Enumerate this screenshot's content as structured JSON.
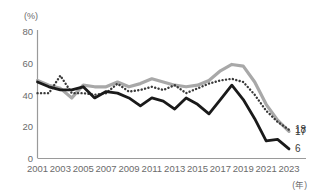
{
  "chart_data": {
    "type": "line",
    "title": "",
    "subtitle": "",
    "xlabel": "(年)",
    "ylabel": "(%)",
    "ylim": [
      0,
      80
    ],
    "xlim": [
      2001,
      2023
    ],
    "grid": false,
    "legend_position": "end-labels",
    "y_ticks": [
      "0",
      "20",
      "40",
      "60",
      "80"
    ],
    "y_tick_values": [
      0,
      20,
      40,
      60,
      80
    ],
    "x_ticks": [
      "2001",
      "2003",
      "2005",
      "2007",
      "2009",
      "2011",
      "2013",
      "2015",
      "2017",
      "2019",
      "2021",
      "2023"
    ],
    "x_tick_values": [
      2001,
      2003,
      2005,
      2007,
      2009,
      2011,
      2013,
      2015,
      2017,
      2019,
      2021,
      2023
    ],
    "x": [
      2001,
      2002,
      2003,
      2004,
      2005,
      2006,
      2007,
      2008,
      2009,
      2010,
      2011,
      2012,
      2013,
      2014,
      2015,
      2016,
      2017,
      2018,
      2019,
      2020,
      2021,
      2022,
      2023
    ],
    "series": [
      {
        "name": "gray-solid-series",
        "style": "solid",
        "color": "#a8a8a8",
        "end_label": "17",
        "values": [
          49,
          46,
          44,
          38,
          46,
          45,
          45,
          48,
          45,
          47,
          50,
          48,
          46,
          45,
          46,
          49,
          55,
          59,
          58,
          48,
          34,
          24,
          17
        ]
      },
      {
        "name": "black-solid-series",
        "style": "solid",
        "color": "#1a1a1a",
        "end_label": "6",
        "values": [
          48,
          45,
          43,
          43,
          45,
          38,
          42,
          41,
          38,
          33,
          38,
          36,
          31,
          38,
          34,
          28,
          37,
          46,
          37,
          25,
          11,
          12,
          6
        ]
      },
      {
        "name": "dotted-series",
        "style": "dotted",
        "color": "#3a3a3a",
        "end_label": "18",
        "values": [
          41,
          41,
          52,
          41,
          41,
          40,
          41,
          47,
          42,
          43,
          45,
          43,
          46,
          41,
          44,
          47,
          49,
          50,
          48,
          40,
          30,
          23,
          18
        ]
      }
    ]
  }
}
